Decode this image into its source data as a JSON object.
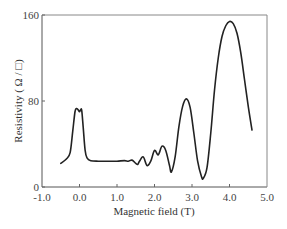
{
  "chart_data": {
    "type": "line",
    "title": "",
    "xlabel": "Magnetic field (T)",
    "ylabel": "Resistivity ( Ω / □)",
    "xlim": [
      -1.0,
      5.0
    ],
    "ylim": [
      0,
      160
    ],
    "x_ticks": [
      "-1.0",
      "0.0",
      "1.0",
      "2.0",
      "3.0",
      "4.0",
      "5.0"
    ],
    "y_ticks": [
      "0",
      "80",
      "160"
    ],
    "grid": false,
    "legend": null,
    "series": [
      {
        "name": "Resistivity",
        "color": "#222222",
        "x": [
          -0.5,
          -0.35,
          -0.25,
          -0.18,
          -0.12,
          -0.08,
          -0.04,
          0.0,
          0.03,
          0.06,
          0.1,
          0.15,
          0.2,
          0.3,
          0.5,
          0.8,
          1.0,
          1.2,
          1.3,
          1.4,
          1.5,
          1.55,
          1.6,
          1.7,
          1.8,
          1.9,
          2.0,
          2.1,
          2.2,
          2.3,
          2.4,
          2.45,
          2.55,
          2.65,
          2.75,
          2.85,
          2.95,
          3.05,
          3.15,
          3.25,
          3.3,
          3.4,
          3.5,
          3.6,
          3.7,
          3.8,
          3.9,
          4.0,
          4.1,
          4.2,
          4.3,
          4.4,
          4.5,
          4.6
        ],
        "values": [
          22,
          26,
          32,
          52,
          70,
          73,
          72,
          70,
          72,
          71,
          55,
          34,
          27,
          24.5,
          24,
          24,
          24,
          24.5,
          24,
          25,
          22,
          21,
          24,
          28,
          20,
          24,
          34,
          30,
          38,
          34,
          20,
          14,
          28,
          56,
          75,
          82,
          74,
          50,
          24,
          10,
          8,
          18,
          50,
          90,
          120,
          140,
          150,
          154,
          152,
          143,
          125,
          100,
          75,
          53
        ]
      }
    ]
  },
  "axes": {
    "xlabel": "Magnetic field (T)",
    "ylabel": "Resistivity ( Ω / □)"
  }
}
